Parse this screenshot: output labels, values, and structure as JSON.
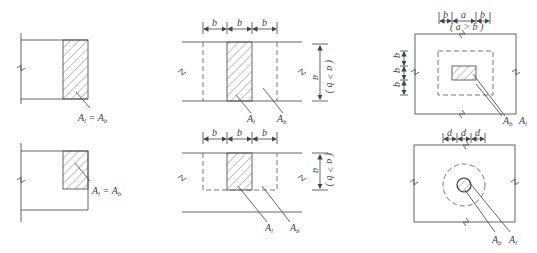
{
  "caption": "",
  "hatch_color": "#555555",
  "line_color": "#555555",
  "panels": [
    {
      "id": "a1",
      "label_main": "A",
      "label_sub": "l",
      "eq": " = ",
      "label2_main": "A",
      "label2_sub": "b"
    },
    {
      "id": "a2",
      "label_main": "A",
      "label_sub": "l",
      "eq": " = ",
      "label2_main": "A",
      "label2_sub": "b"
    },
    {
      "id": "b1",
      "dims": [
        "b",
        "b",
        "b"
      ],
      "vdim": "a",
      "cond": "( a > b )",
      "al": "A",
      "al_sub": "l",
      "ab": "A",
      "ab_sub": "b"
    },
    {
      "id": "b2",
      "dims": [
        "b",
        "b",
        "b"
      ],
      "vdim": "a",
      "cond": "( a > b )",
      "al": "A",
      "al_sub": "l",
      "ab": "A",
      "ab_sub": "b"
    },
    {
      "id": "c1",
      "dims": [
        "b",
        "a",
        "b"
      ],
      "cond": "( a > b )",
      "vdims": [
        "b",
        "b",
        "b"
      ],
      "ab": "A",
      "ab_sub": "b",
      "al": "A",
      "al_sub": "l"
    },
    {
      "id": "c2",
      "dims": [
        "d",
        "d",
        "d"
      ],
      "ab": "A",
      "ab_sub": "b",
      "al": "A",
      "al_sub": "l"
    }
  ]
}
